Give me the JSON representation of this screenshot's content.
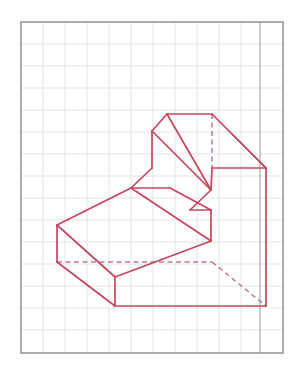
{
  "sheet": {
    "title": "Kavalierperspektive",
    "background_color": "#ffffff",
    "border_color": "#8a8a8a",
    "grid_color": "#e2e2e6",
    "line_color": "#c9455c",
    "hidden_line_color": "#c9788c",
    "accent_dark_color": "#3c2a30"
  },
  "grid": {
    "x": 21,
    "y": 22,
    "width": 262,
    "height": 331,
    "cell": 22.0,
    "columns": 12,
    "rows": 15,
    "title_column_x": 260
  },
  "drawing": {
    "type": "cavalier-perspective",
    "description": "Stepped L-shaped solid drawn in cavalier oblique projection on a square grid",
    "visible_edges": [
      [
        152,
        131,
        167,
        114
      ],
      [
        167,
        114,
        212,
        114
      ],
      [
        212,
        114,
        266,
        168
      ],
      [
        152,
        131,
        152,
        168
      ],
      [
        152,
        168,
        131,
        188
      ],
      [
        131,
        188,
        170,
        188
      ],
      [
        152,
        131,
        211,
        190
      ],
      [
        211,
        190,
        212,
        168
      ],
      [
        212,
        168,
        266,
        168
      ],
      [
        211,
        190,
        190,
        210
      ],
      [
        190,
        210,
        211,
        210
      ],
      [
        167,
        114,
        211,
        190
      ],
      [
        212,
        114,
        212,
        168
      ],
      [
        131,
        188,
        57,
        225
      ],
      [
        131,
        188,
        211,
        241
      ],
      [
        211,
        241,
        211,
        210
      ],
      [
        57,
        225,
        57,
        262
      ],
      [
        57,
        262,
        115,
        306
      ],
      [
        115,
        306,
        266,
        306
      ],
      [
        266,
        306,
        266,
        168
      ],
      [
        57,
        225,
        115,
        277
      ],
      [
        115,
        277,
        211,
        241
      ],
      [
        115,
        277,
        115,
        306
      ],
      [
        170,
        188,
        211,
        210
      ]
    ],
    "hidden_edges": [
      [
        57,
        262,
        212,
        262
      ],
      [
        212,
        262,
        266,
        306
      ],
      [
        212,
        114,
        212,
        168
      ]
    ],
    "dark_edge": [
      232,
      134,
      266,
      168
    ]
  }
}
